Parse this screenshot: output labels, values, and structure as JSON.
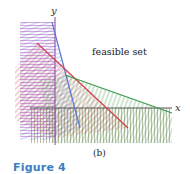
{
  "figure": {
    "axis_x_label": "x",
    "axis_y_label": "y",
    "region_label": "feasible set",
    "subfigure_label": "(b)",
    "caption": "Figure 4"
  },
  "colors": {
    "blue": "#5a78d0",
    "red": "#d0404a",
    "green": "#3a9a4a",
    "magenta": "#c060c8",
    "olive": "#8a8a60",
    "axis": "#555555",
    "caption": "#3a7fc0"
  }
}
